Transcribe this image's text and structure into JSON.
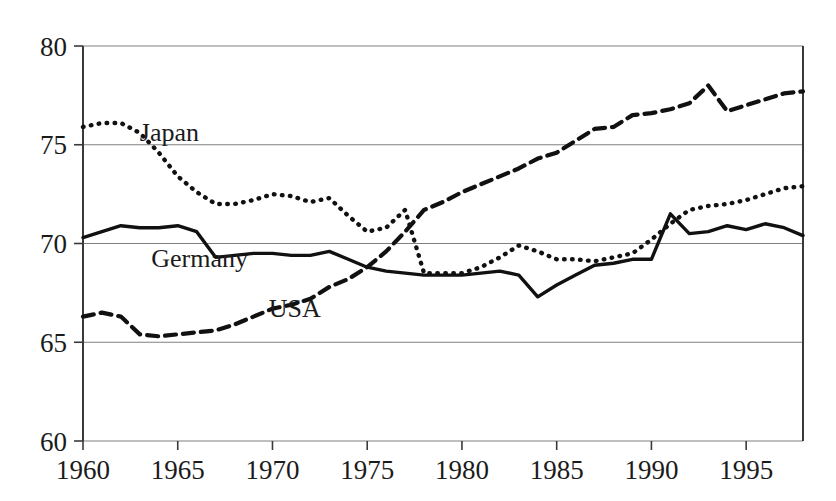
{
  "chart_data": {
    "type": "line",
    "title": "",
    "subtitle": "",
    "xlabel": "",
    "ylabel": "",
    "xlim": [
      1960,
      1998
    ],
    "ylim": [
      60,
      80
    ],
    "grid": true,
    "legend_position": "inline-labels",
    "x_ticks": [
      1960,
      1965,
      1970,
      1975,
      1980,
      1985,
      1990,
      1995
    ],
    "x_tick_labels": [
      "1960",
      "1965",
      "1970",
      "1975",
      "1980",
      "1985",
      "1990",
      "1995"
    ],
    "y_ticks": [
      60,
      65,
      70,
      75,
      80
    ],
    "y_tick_labels": [
      "60",
      "65",
      "70",
      "75",
      "80"
    ],
    "x": [
      1960,
      1961,
      1962,
      1963,
      1964,
      1965,
      1966,
      1967,
      1968,
      1969,
      1970,
      1971,
      1972,
      1973,
      1974,
      1975,
      1976,
      1977,
      1978,
      1979,
      1980,
      1981,
      1982,
      1983,
      1984,
      1985,
      1986,
      1987,
      1988,
      1989,
      1990,
      1991,
      1992,
      1993,
      1994,
      1995,
      1996,
      1997,
      1998
    ],
    "series": [
      {
        "name": "Japan",
        "style": "dotted",
        "color": "#111111",
        "label_x": 1963.0,
        "label_y": 75.2,
        "values": [
          75.9,
          76.1,
          76.1,
          75.6,
          74.6,
          73.4,
          72.6,
          72.0,
          72.0,
          72.2,
          72.5,
          72.4,
          72.1,
          72.3,
          71.4,
          70.6,
          70.8,
          71.7,
          68.5,
          68.5,
          68.5,
          68.8,
          69.3,
          69.9,
          69.6,
          69.2,
          69.2,
          69.1,
          69.3,
          69.5,
          70.2,
          71.0,
          71.7,
          71.9,
          72.0,
          72.2,
          72.5,
          72.8,
          72.9
        ]
      },
      {
        "name": "Germany",
        "style": "solid",
        "color": "#111111",
        "label_x": 1963.6,
        "label_y": 68.8,
        "values": [
          70.3,
          70.6,
          70.9,
          70.8,
          70.8,
          70.9,
          70.6,
          69.3,
          69.4,
          69.5,
          69.5,
          69.4,
          69.4,
          69.6,
          69.2,
          68.8,
          68.6,
          68.5,
          68.4,
          68.4,
          68.4,
          68.5,
          68.6,
          68.4,
          67.3,
          67.9,
          68.4,
          68.9,
          69.0,
          69.2,
          69.2,
          71.5,
          70.5,
          70.6,
          70.9,
          70.7,
          71.0,
          70.8,
          70.4
        ]
      },
      {
        "name": "USA",
        "style": "dashed",
        "color": "#111111",
        "label_x": 1969.8,
        "label_y": 66.3,
        "values": [
          66.3,
          66.5,
          66.3,
          65.4,
          65.3,
          65.4,
          65.5,
          65.6,
          65.9,
          66.3,
          66.7,
          66.9,
          67.2,
          67.8,
          68.2,
          68.8,
          69.6,
          70.6,
          71.7,
          72.1,
          72.6,
          73.0,
          73.4,
          73.8,
          74.3,
          74.6,
          75.2,
          75.8,
          75.9,
          76.5,
          76.6,
          76.8,
          77.1,
          78.0,
          76.7,
          77.0,
          77.3,
          77.6,
          77.7
        ]
      }
    ]
  }
}
